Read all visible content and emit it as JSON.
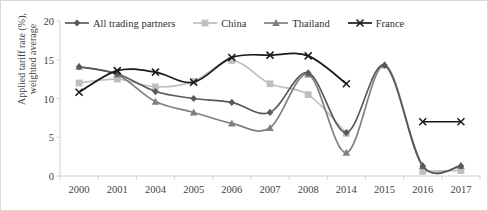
{
  "chart_data": {
    "type": "line",
    "title": "",
    "xlabel": "",
    "ylabel": "Applied tariff rate (%),\nweighted average",
    "ylim": [
      0,
      20
    ],
    "yticks": [
      0,
      5,
      10,
      15,
      20
    ],
    "grid": false,
    "legend_position": "top",
    "categories": [
      "2000",
      "2001",
      "2004",
      "2005",
      "2006",
      "2007",
      "2008",
      "2014",
      "2015",
      "2016",
      "2017"
    ],
    "series": [
      {
        "name": "All trading partners",
        "marker": "diamond",
        "color": "#595959",
        "values": [
          14.1,
          13.2,
          10.9,
          10.0,
          9.5,
          8.2,
          13.3,
          5.6,
          14.3,
          1.3,
          1.3
        ]
      },
      {
        "name": "China",
        "marker": "square",
        "color": "#bfbfbf",
        "values": [
          12.0,
          12.5,
          11.5,
          12.2,
          14.9,
          11.9,
          10.5,
          5.5,
          null,
          0.6,
          0.7
        ]
      },
      {
        "name": "Thailand",
        "marker": "triangle",
        "color": "#808080",
        "values": [
          14.1,
          13.1,
          9.6,
          8.2,
          6.8,
          6.2,
          13.1,
          3.0,
          14.3,
          1.3,
          1.3
        ]
      },
      {
        "name": "France",
        "marker": "x",
        "color": "#1a1a1a",
        "values": [
          10.8,
          13.6,
          13.4,
          12.1,
          15.3,
          15.6,
          15.5,
          11.9,
          null,
          7.0,
          7.0
        ]
      }
    ]
  },
  "legend": {
    "items": [
      {
        "label": "All trading partners"
      },
      {
        "label": "China"
      },
      {
        "label": "Thailand"
      },
      {
        "label": "France"
      }
    ]
  },
  "axes": {
    "y_title": "Applied tariff rate (%),\nweighted average",
    "y_ticks": [
      "20",
      "15",
      "10",
      "5",
      "0"
    ],
    "x_ticks": [
      "2000",
      "2001",
      "2004",
      "2005",
      "2006",
      "2007",
      "2008",
      "2014",
      "2015",
      "2016",
      "2017"
    ]
  }
}
